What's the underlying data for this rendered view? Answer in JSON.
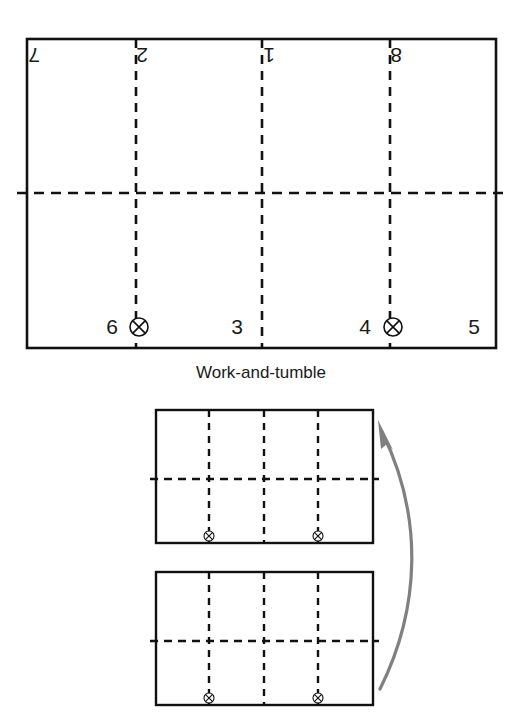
{
  "figure": {
    "caption": "Work-and-tumble",
    "colors": {
      "ink": "#111111",
      "text": "#1a1a1a",
      "arrow": "#808080",
      "paper": "#ffffff"
    }
  },
  "sheet": {
    "label": "imposition-sheet",
    "geometry": {
      "x": 27,
      "y": 39,
      "width": 469,
      "height": 309
    },
    "fold_lines": {
      "vertical_x": [
        136,
        262,
        390
      ],
      "horizontal_y": 193
    },
    "top_row_pages": [
      {
        "number": "7",
        "x": 40,
        "y": 62,
        "rotated": true
      },
      {
        "number": "2",
        "x": 148,
        "y": 62,
        "rotated": true
      },
      {
        "number": "1",
        "x": 275,
        "y": 62,
        "rotated": true
      },
      {
        "number": "8",
        "x": 402,
        "y": 62,
        "rotated": true
      }
    ],
    "bottom_row_pages": [
      {
        "number": "6",
        "x": 118,
        "y": 334,
        "rotated": false
      },
      {
        "number": "3",
        "x": 243,
        "y": 334,
        "rotated": false
      },
      {
        "number": "4",
        "x": 371,
        "y": 334,
        "rotated": false
      },
      {
        "number": "5",
        "x": 480,
        "y": 334,
        "rotated": false
      }
    ],
    "collation_marks": [
      {
        "cx": 139,
        "cy": 327,
        "r": 9
      },
      {
        "cx": 393,
        "cy": 327,
        "r": 9
      }
    ]
  },
  "thumbnails": [
    {
      "label": "thumbnail-top",
      "geometry": {
        "x": 156,
        "y": 410,
        "width": 217,
        "height": 133
      },
      "fold_lines": {
        "vertical_x": [
          209,
          264,
          318
        ],
        "horizontal_y": 479
      },
      "collation_marks": [
        {
          "cx": 209,
          "cy": 536,
          "r": 5
        },
        {
          "cx": 318,
          "cy": 536,
          "r": 5
        }
      ]
    },
    {
      "label": "thumbnail-bottom",
      "geometry": {
        "x": 156,
        "y": 572,
        "width": 217,
        "height": 133
      },
      "fold_lines": {
        "vertical_x": [
          209,
          264,
          318
        ],
        "horizontal_y": 641
      },
      "collation_marks": [
        {
          "cx": 209,
          "cy": 698,
          "r": 5
        },
        {
          "cx": 318,
          "cy": 698,
          "r": 5
        }
      ]
    }
  ],
  "tumble_arrow": {
    "label": "tumble-arrow",
    "direction": "bottom-to-top",
    "start": {
      "x": 380,
      "y": 689
    },
    "end": {
      "x": 382,
      "y": 432
    }
  },
  "caption_position": {
    "x": 261,
    "y": 378
  }
}
